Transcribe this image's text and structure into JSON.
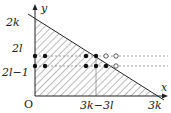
{
  "diagram": {
    "axes": {
      "x_label": "x",
      "y_label": "y",
      "origin_label": "O"
    },
    "y_ticks": [
      {
        "label": "2k",
        "pos": "top"
      },
      {
        "label": "2l",
        "pos": "upper_row"
      },
      {
        "label": "2l−1",
        "pos": "lower_row"
      }
    ],
    "x_ticks": [
      {
        "label": "3k−3l"
      },
      {
        "label": "3k"
      }
    ],
    "region": "shaded triangle between axes and line from (0,2k) to (3k,0)",
    "rows": [
      {
        "label": "2l",
        "filled": 4,
        "open": 2
      },
      {
        "label": "2l−1",
        "filled": 5,
        "open": 1
      }
    ]
  }
}
